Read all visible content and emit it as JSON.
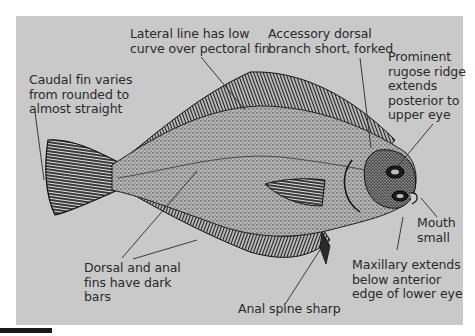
{
  "figure": {
    "background_color": "#c9c9c9",
    "ink_color": "#1e1e1e",
    "text_color": "#2a2a2a"
  },
  "labels": {
    "caudal_fin": "Caudal fin varies\nfrom rounded to\nalmost straight",
    "lateral_line": "Lateral line has low\ncurve over pectoral fin",
    "accessory_dorsal": "Accessory dorsal\nbranch short, forked",
    "rugose_ridge": "Prominent\nrugose ridge\nextends\nposterior to\nupper eye",
    "mouth": "Mouth\nsmall",
    "maxillary": "Maxillary extends\nbelow anterior\nedge of lower eye",
    "anal_spine": "Anal spine sharp",
    "fins_bars": "Dorsal and anal\nfins have dark\nbars"
  }
}
